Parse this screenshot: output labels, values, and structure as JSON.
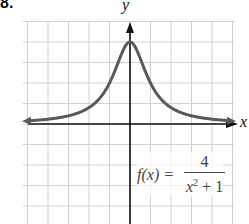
{
  "problem_number": "8.",
  "chart_data": {
    "type": "line",
    "title": "",
    "function_label": "f(x) = 4 / (x^2 + 1)",
    "formula": {
      "lhs": "f(x) =",
      "numerator": "4",
      "denominator_base": "x",
      "denominator_exp": "2",
      "denominator_rest": " + 1"
    },
    "xlabel": "x",
    "ylabel": "y",
    "grid": true,
    "xlim": [
      -5,
      5
    ],
    "ylim": [
      -5,
      5
    ],
    "x": [
      -5,
      -4,
      -3,
      -2,
      -1.5,
      -1,
      -0.5,
      0,
      0.5,
      1,
      1.5,
      2,
      3,
      4,
      5
    ],
    "values": [
      0.154,
      0.235,
      0.4,
      0.8,
      1.231,
      2,
      3.2,
      4,
      3.2,
      2,
      1.231,
      0.8,
      0.4,
      0.235,
      0.154
    ],
    "asymptote": "y = 0",
    "max_point": [
      0,
      4
    ],
    "colors": {
      "curve": "#5a5a5a",
      "grid": "#d0d0d0",
      "axis": "#111111"
    }
  }
}
